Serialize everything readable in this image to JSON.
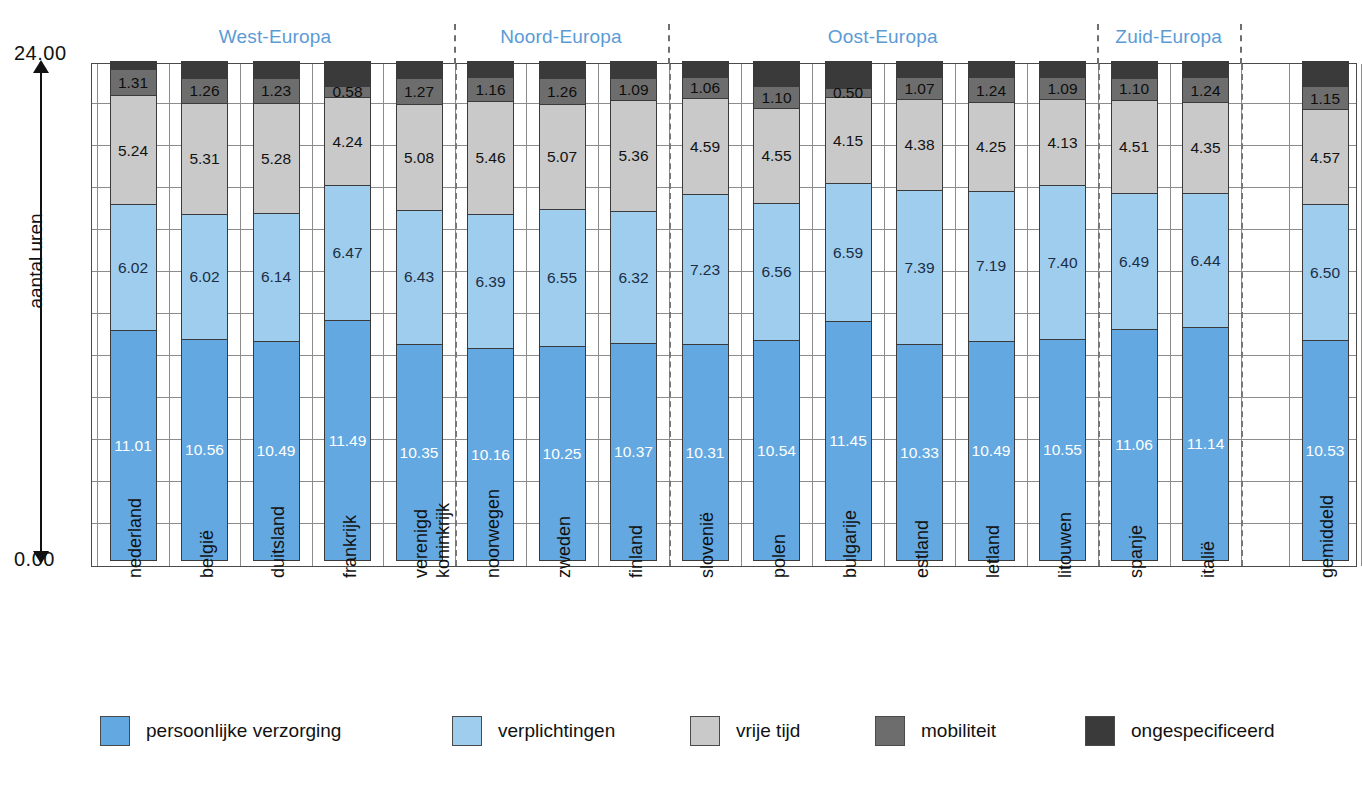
{
  "axis": {
    "top_value": "24.00",
    "bottom_value": "0.00",
    "y_title": "aantal uren"
  },
  "groups": [
    {
      "label": "West-Europa",
      "start": 0,
      "end": 4
    },
    {
      "label": "Noord-Europa",
      "start": 5,
      "end": 7
    },
    {
      "label": "Oost-Europa",
      "start": 8,
      "end": 13
    },
    {
      "label": "Zuid-Europa",
      "start": 14,
      "end": 15
    }
  ],
  "legend": [
    {
      "label": "persoonlijke verzorging",
      "color": "#63a8e0",
      "key": "persoonlijke"
    },
    {
      "label": "verplichtingen",
      "color": "#9fcdee",
      "key": "verplichtingen"
    },
    {
      "label": "vrije tijd",
      "color": "#c9c9c9",
      "key": "vrije"
    },
    {
      "label": "mobiliteit",
      "color": "#6d6d6d",
      "key": "mobiliteit"
    },
    {
      "label": "ongespecificeerd",
      "color": "#3a3a3a",
      "key": "ongespec"
    }
  ],
  "chart_data": {
    "type": "bar",
    "subtype": "stacked-vertical",
    "title": "",
    "xlabel": "",
    "ylabel": "aantal uren",
    "ylim": [
      0,
      24
    ],
    "ytick_labels": [
      "0.00",
      "24.00"
    ],
    "grid": true,
    "grid_interval": 2,
    "legend_position": "bottom",
    "categories": [
      "nederland",
      "belgië",
      "duitsland",
      "frankrijk",
      "verenigd koninkrijk",
      "noorwegen",
      "zweden",
      "finland",
      "slovenië",
      "polen",
      "bulgarije",
      "estland",
      "letland",
      "litouwen",
      "spanje",
      "italië",
      "gemiddeld"
    ],
    "category_lines": [
      [
        "nederland"
      ],
      [
        "belgië"
      ],
      [
        "duitsland"
      ],
      [
        "frankrijk"
      ],
      [
        "verenigd",
        "koninkrijk"
      ],
      [
        "noorwegen"
      ],
      [
        "zweden"
      ],
      [
        "finland"
      ],
      [
        "slovenië"
      ],
      [
        "polen"
      ],
      [
        "bulgarije"
      ],
      [
        "estland"
      ],
      [
        "letland"
      ],
      [
        "litouwen"
      ],
      [
        "spanje"
      ],
      [
        "italië"
      ],
      [
        "gemiddeld"
      ]
    ],
    "series": [
      {
        "name": "persoonlijke verzorging",
        "color": "#63a8e0",
        "values": [
          11.01,
          10.56,
          10.49,
          11.49,
          10.35,
          10.16,
          10.25,
          10.37,
          10.31,
          10.54,
          11.45,
          10.33,
          10.49,
          10.55,
          11.06,
          11.14,
          10.53
        ]
      },
      {
        "name": "verplichtingen",
        "color": "#9fcdee",
        "values": [
          6.02,
          6.02,
          6.14,
          6.47,
          6.43,
          6.39,
          6.55,
          6.32,
          7.23,
          6.56,
          6.59,
          7.39,
          7.19,
          7.4,
          6.49,
          6.44,
          6.5
        ]
      },
      {
        "name": "vrije tijd",
        "color": "#c9c9c9",
        "values": [
          5.24,
          5.31,
          5.28,
          4.24,
          5.08,
          5.46,
          5.07,
          5.36,
          4.59,
          4.55,
          4.15,
          4.38,
          4.25,
          4.13,
          4.51,
          4.35,
          4.57
        ]
      },
      {
        "name": "mobiliteit",
        "color": "#6d6d6d",
        "values": [
          1.31,
          1.26,
          1.23,
          0.58,
          1.27,
          1.16,
          1.26,
          1.09,
          1.06,
          1.1,
          0.5,
          1.07,
          1.24,
          1.09,
          1.1,
          1.24,
          1.15
        ]
      },
      {
        "name": "ongespecificeerd",
        "color": "#3a3a3a",
        "values": [
          0.42,
          0.85,
          0.86,
          1.22,
          0.87,
          0.83,
          0.87,
          0.86,
          0.81,
          1.25,
          1.31,
          0.83,
          0.83,
          0.83,
          0.84,
          0.83,
          1.25
        ]
      }
    ]
  }
}
